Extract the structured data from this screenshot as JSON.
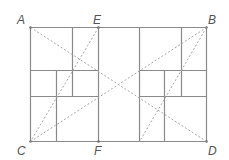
{
  "diagram": {
    "colors": {
      "solid": "#8a8a8a",
      "dashed": "#a8a8a8",
      "label": "#555555"
    },
    "points": [
      {
        "id": "A",
        "label": "A",
        "x": 30,
        "y": 27,
        "lx": 17,
        "ly": 14
      },
      {
        "id": "E",
        "label": "E",
        "x": 98,
        "y": 27,
        "lx": 93,
        "ly": 14
      },
      {
        "id": "B",
        "label": "B",
        "x": 206,
        "y": 27,
        "lx": 208,
        "ly": 14
      },
      {
        "id": "C",
        "label": "C",
        "x": 30,
        "y": 141,
        "lx": 17,
        "ly": 145
      },
      {
        "id": "F",
        "label": "F",
        "x": 98,
        "y": 141,
        "lx": 94,
        "ly": 145
      },
      {
        "id": "D",
        "label": "D",
        "x": 206,
        "y": 141,
        "lx": 208,
        "ly": 145
      }
    ],
    "solid_lines": [
      [
        30,
        27,
        206,
        27
      ],
      [
        30,
        141,
        206,
        141
      ],
      [
        30,
        27,
        30,
        141
      ],
      [
        206,
        27,
        206,
        141
      ],
      [
        98,
        27,
        98,
        141
      ],
      [
        139,
        27,
        139,
        141
      ],
      [
        72,
        27,
        72,
        96
      ],
      [
        56,
        70,
        56,
        141
      ],
      [
        30,
        70,
        98,
        70
      ],
      [
        30,
        96,
        98,
        96
      ],
      [
        181,
        27,
        181,
        96
      ],
      [
        164,
        70,
        164,
        141
      ],
      [
        139,
        70,
        206,
        70
      ],
      [
        139,
        96,
        206,
        96
      ]
    ],
    "dashed_lines": [
      [
        30,
        27,
        206,
        141
      ],
      [
        30,
        141,
        206,
        27
      ],
      [
        98,
        27,
        30,
        141
      ],
      [
        206,
        27,
        139,
        141
      ]
    ]
  }
}
